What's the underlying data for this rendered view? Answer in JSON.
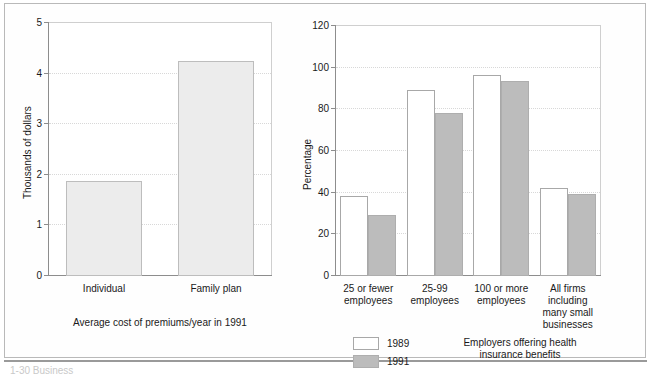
{
  "figure": {
    "bottom_cut_text": "1-30 Business"
  },
  "chart_data": [
    {
      "id": "left",
      "type": "bar",
      "title": "",
      "caption": "Average cost of premiums/year in 1991",
      "xlabel": "",
      "ylabel": "Thousands of dollars",
      "categories": [
        "Individual",
        "Family plan"
      ],
      "values": [
        1.85,
        4.22
      ],
      "ylim": [
        0,
        5
      ],
      "yticks": [
        0,
        1,
        2,
        3,
        4,
        5
      ],
      "ytick_labels": [
        "0",
        "1",
        "2",
        "3",
        "4",
        "5"
      ],
      "grid": true,
      "legend": false,
      "bar_color": "#ececec",
      "bar_border": "#bdbdbd"
    },
    {
      "id": "right",
      "type": "bar",
      "title": "",
      "caption": "Employers offering health insurance benefits",
      "caption_line1": "Employers offering health",
      "caption_line2": "insurance benefits",
      "xlabel": "",
      "ylabel": "Percentage",
      "categories": [
        "25 or fewer employees",
        "25-99 employees",
        "100 or more employees",
        "All firms including many small businesses"
      ],
      "category_lines": [
        [
          "25 or fewer",
          "employees"
        ],
        [
          "25-99",
          "employees"
        ],
        [
          "100 or more",
          "employees"
        ],
        [
          "All firms including",
          "many small",
          "businesses"
        ]
      ],
      "series": [
        {
          "name": "1989",
          "values": [
            38,
            89,
            96,
            42
          ],
          "color": "#ffffff",
          "border": "#a8a8a8"
        },
        {
          "name": "1991",
          "values": [
            29,
            78,
            93,
            39
          ],
          "color": "#bcbcbc",
          "border": "#aeaeae"
        }
      ],
      "ylim": [
        0,
        120
      ],
      "yticks": [
        0,
        20,
        40,
        60,
        80,
        100,
        120
      ],
      "ytick_labels": [
        "0",
        "20",
        "40",
        "60",
        "80",
        "100",
        "120"
      ],
      "grid": true,
      "legend": true,
      "legend_position": "bottom-left"
    }
  ]
}
